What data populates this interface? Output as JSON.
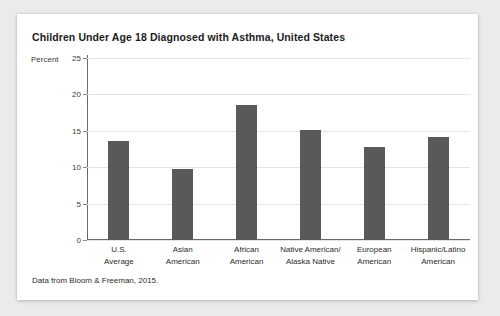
{
  "card": {
    "source_note": "Data from Bloom & Freeman, 2015."
  },
  "chart_data": {
    "type": "bar",
    "title": "Children Under Age 18 Diagnosed with Asthma, United States",
    "xlabel": "",
    "ylabel": "Percent",
    "ylim": [
      0,
      25
    ],
    "yticks": [
      0,
      5,
      10,
      15,
      20,
      25
    ],
    "ytick_labels": [
      "0",
      "5",
      "10",
      "15",
      "20",
      "25"
    ],
    "grid": true,
    "legend": "none",
    "bar_color": "#595959",
    "categories": [
      "U.S.\nAverage",
      "Asian\nAmerican",
      "African\nAmerican",
      "Native American/\nAlaska Native",
      "European\nAmerican",
      "Hispanic/Latino\nAmerican"
    ],
    "category_lines": [
      [
        "U.S.",
        "Average"
      ],
      [
        "Asian",
        "American"
      ],
      [
        "African",
        "American"
      ],
      [
        "Native American/",
        "Alaska Native"
      ],
      [
        "European",
        "American"
      ],
      [
        "Hispanic/Latino",
        "American"
      ]
    ],
    "values": [
      13.6,
      9.7,
      18.6,
      15.1,
      12.8,
      14.2
    ],
    "source": "Data from Bloom & Freeman, 2015."
  }
}
